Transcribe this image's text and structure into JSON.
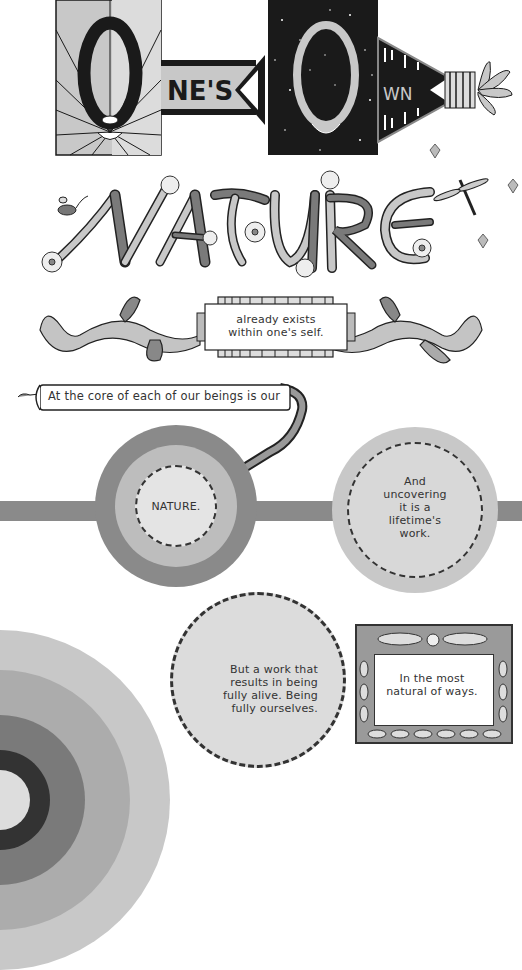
{
  "header": {
    "title_parts": [
      "O",
      "NE'S",
      "O",
      "WN"
    ],
    "title_full": "One's Own",
    "subtitle": "NATURE"
  },
  "banner": {
    "text_line1": "already exists",
    "text_line2": "within one's self."
  },
  "scroll": {
    "text": "At the core of each of our beings is our"
  },
  "circles": [
    {
      "id": "nature",
      "text": "NATURE."
    },
    {
      "id": "uncovering",
      "lines": [
        "And",
        "uncovering",
        "it is a",
        "lifetime's",
        "work."
      ]
    },
    {
      "id": "fully-alive",
      "lines": [
        "But a work that",
        "results in being",
        "fully alive. Being",
        "fully ourselves."
      ]
    }
  ],
  "frame": {
    "lines": [
      "In the most",
      "natural of ways."
    ]
  },
  "colors": {
    "black": "#1a1a1a",
    "dark_gray": "#6e6e6e",
    "mid_gray": "#9a9a9a",
    "light_gray": "#c4c4c4",
    "pale_gray": "#dcdcdc",
    "bg": "#ffffff"
  }
}
